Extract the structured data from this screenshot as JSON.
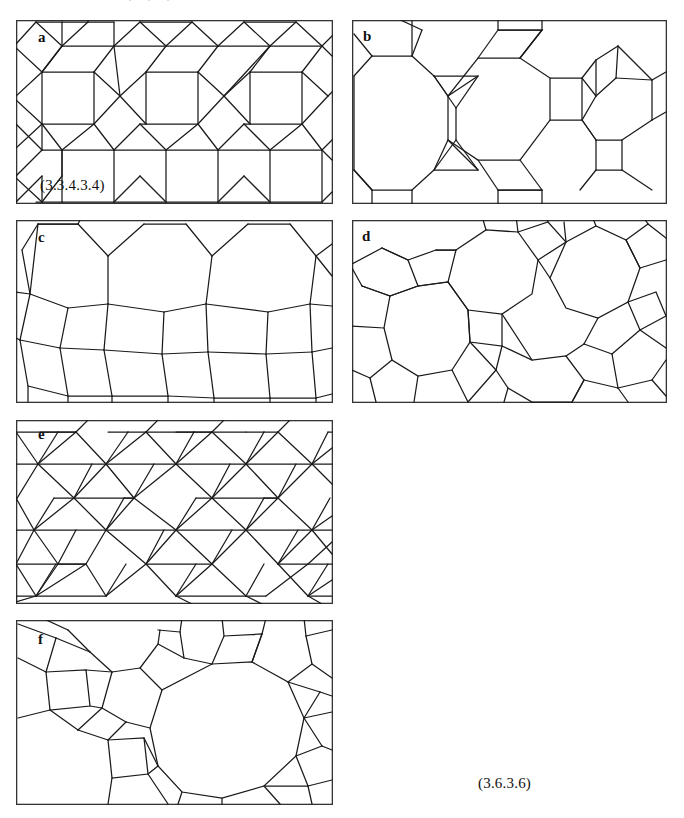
{
  "figure": {
    "background_color": "#ffffff",
    "line_color": "#1a1a1a",
    "frame_color": "#333333",
    "width": 684,
    "height": 818,
    "cropped_caption_fragment": "· · ·"
  },
  "panels": [
    {
      "id": "a",
      "label": "a",
      "tiling_name": "snub square tiling",
      "vertex_configuration": "(3.3.4.3.4)",
      "annotation_visible": true,
      "annotation_text": "(3.3.4.3.4)",
      "x": 16,
      "y": 20,
      "w": 317,
      "h": 184
    },
    {
      "id": "b",
      "label": "b",
      "tiling_name": "truncated hexagonal tiling",
      "vertex_configuration": "(3.12.12)",
      "annotation_visible": false,
      "annotation_text": "",
      "x": 352,
      "y": 20,
      "w": 315,
      "h": 184
    },
    {
      "id": "c",
      "label": "c",
      "tiling_name": "hexagonal tiling",
      "vertex_configuration": "(6.6.6)",
      "annotation_visible": false,
      "annotation_text": "",
      "x": 16,
      "y": 220,
      "w": 317,
      "h": 183
    },
    {
      "id": "d",
      "label": "d",
      "tiling_name": "truncated square tiling",
      "vertex_configuration": "(4.8.8)",
      "annotation_visible": false,
      "annotation_text": "",
      "x": 352,
      "y": 220,
      "w": 315,
      "h": 183
    },
    {
      "id": "e",
      "label": "e",
      "tiling_name": "snub hexagonal tiling",
      "vertex_configuration": "(3.3.3.3.6)",
      "annotation_visible": false,
      "annotation_text": "",
      "x": 16,
      "y": 420,
      "w": 317,
      "h": 184
    },
    {
      "id": "f",
      "label": "f",
      "tiling_name": "truncated trihexagonal tiling",
      "vertex_configuration": "(4.6.12)",
      "annotation_visible": false,
      "annotation_text": "",
      "x": 16,
      "y": 620,
      "w": 317,
      "h": 185
    }
  ],
  "standalone_annotations": [
    {
      "text": "(3.6.3.6)",
      "x": 478,
      "y": 775,
      "name": "vertex-config-3636"
    }
  ]
}
